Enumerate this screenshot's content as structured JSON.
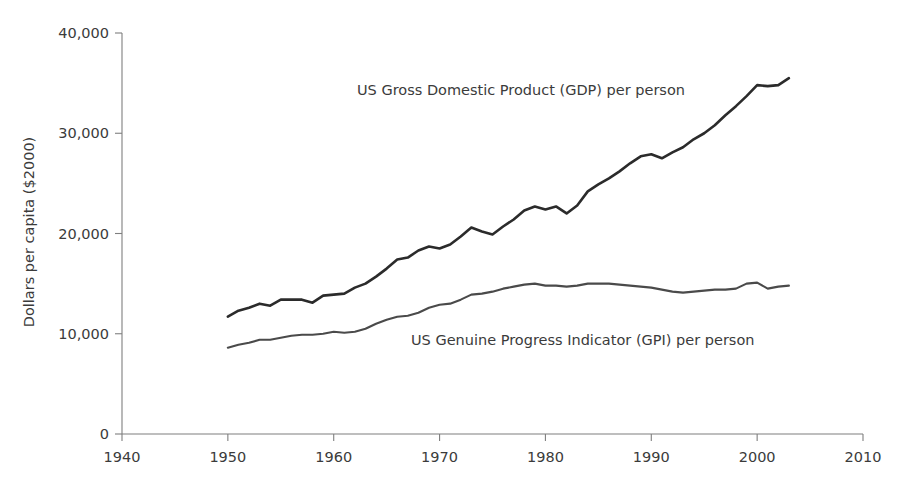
{
  "chart_data": {
    "type": "line",
    "title": "",
    "subtitle": "",
    "xlabel": "",
    "ylabel": "Dollars per capita ($2000)",
    "xlim": [
      1940,
      2010
    ],
    "ylim": [
      0,
      40000
    ],
    "x_ticks": [
      "1940",
      "1950",
      "1960",
      "1970",
      "1980",
      "1990",
      "2000",
      "2010"
    ],
    "x_tick_values": [
      1940,
      1950,
      1960,
      1970,
      1980,
      1990,
      2000,
      2010
    ],
    "y_ticks": [
      "0",
      "10,000",
      "20,000",
      "30,000",
      "40,000"
    ],
    "y_tick_values": [
      0,
      10000,
      20000,
      30000,
      40000
    ],
    "grid": false,
    "legend_position": "inline-annotation",
    "x": [
      1950,
      1951,
      1952,
      1953,
      1954,
      1955,
      1956,
      1957,
      1958,
      1959,
      1960,
      1961,
      1962,
      1963,
      1964,
      1965,
      1966,
      1967,
      1968,
      1969,
      1970,
      1971,
      1972,
      1973,
      1974,
      1975,
      1976,
      1977,
      1978,
      1979,
      1980,
      1981,
      1982,
      1983,
      1984,
      1985,
      1986,
      1987,
      1988,
      1989,
      1990,
      1991,
      1992,
      1993,
      1994,
      1995,
      1996,
      1997,
      1998,
      1999,
      2000,
      2001,
      2002,
      2003
    ],
    "series": [
      {
        "name": "US Gross Domestic Product (GDP) per person",
        "color": "#2b2b2b",
        "annotation": "US Gross Domestic Product (GDP) per person",
        "values": [
          11700,
          12300,
          12600,
          13000,
          12800,
          13400,
          13400,
          13400,
          13100,
          13800,
          13900,
          14000,
          14600,
          15000,
          15700,
          16500,
          17400,
          17600,
          18300,
          18700,
          18500,
          18900,
          19700,
          20600,
          20200,
          19900,
          20700,
          21400,
          22300,
          22700,
          22400,
          22700,
          22000,
          22800,
          24200,
          24900,
          25500,
          26200,
          27000,
          27700,
          27900,
          27500,
          28100,
          28600,
          29400,
          30000,
          30800,
          31800,
          32700,
          33700,
          34800,
          34700,
          34800,
          35500
        ]
      },
      {
        "name": "US Genuine Progress Indicator (GPI) per person",
        "color": "#4a4a4a",
        "annotation": "US Genuine Progress Indicator (GPI) per person",
        "values": [
          8600,
          8900,
          9100,
          9400,
          9400,
          9600,
          9800,
          9900,
          9900,
          10000,
          10200,
          10100,
          10200,
          10500,
          11000,
          11400,
          11700,
          11800,
          12100,
          12600,
          12900,
          13000,
          13400,
          13900,
          14000,
          14200,
          14500,
          14700,
          14900,
          15000,
          14800,
          14800,
          14700,
          14800,
          15000,
          15000,
          15000,
          14900,
          14800,
          14700,
          14600,
          14400,
          14200,
          14100,
          14200,
          14300,
          14400,
          14400,
          14500,
          15000,
          15100,
          14500,
          14700,
          14800
        ]
      }
    ]
  },
  "axis": {
    "y_title": "Dollars per capita ($2000)"
  }
}
